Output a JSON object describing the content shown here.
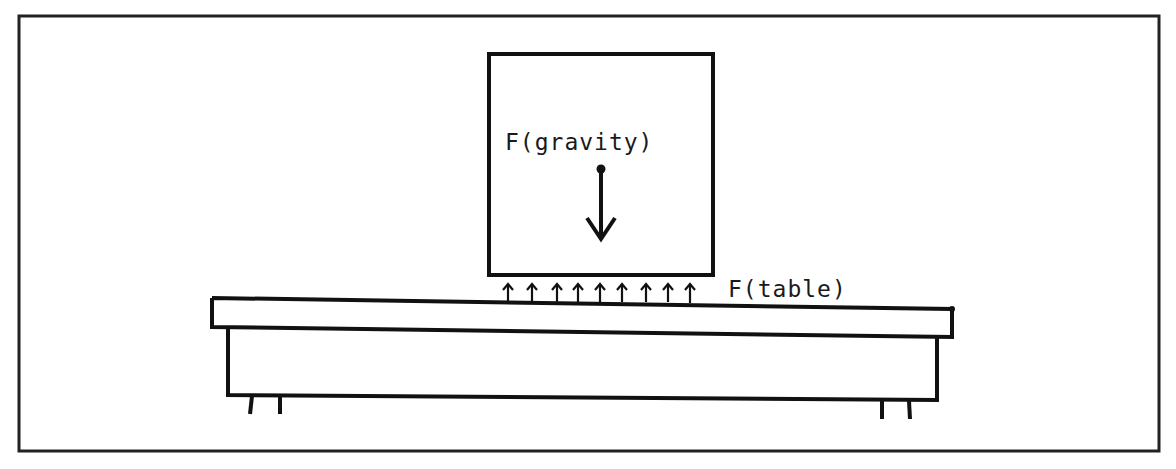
{
  "diagram": {
    "labels": {
      "gravity": "F(gravity)",
      "table": "F(table)"
    },
    "elements": {
      "frame": "outer-border",
      "block": "box-on-table",
      "gravity_arrow": "single-down-arrow-from-center-dot",
      "table_force_arrows": {
        "count": 9,
        "direction": "up"
      },
      "table": "table-top-with-body-and-four-legs"
    },
    "colors": {
      "stroke": "#111111",
      "background": "#ffffff"
    },
    "caption": ""
  }
}
